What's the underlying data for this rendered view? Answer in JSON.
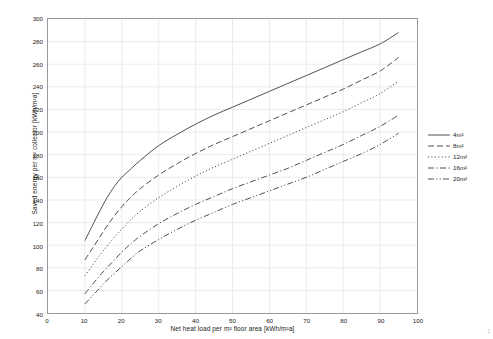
{
  "chart_data": {
    "type": "line",
    "title": "",
    "xlabel": "Net heat load per m² floor area [kWh/m²a]",
    "ylabel": "Saved energy per m² collector [kWh/m²a]",
    "xlim": [
      0,
      100
    ],
    "ylim": [
      40,
      300
    ],
    "xticks": [
      0,
      10,
      20,
      30,
      40,
      50,
      60,
      70,
      80,
      90,
      100
    ],
    "yticks": [
      40,
      60,
      80,
      100,
      120,
      140,
      160,
      180,
      200,
      220,
      240,
      260,
      280,
      300
    ],
    "grid": true,
    "grid_color": "#e2e2e8",
    "legend_position": "right",
    "x": [
      10,
      12,
      14,
      16,
      18,
      20,
      22,
      25,
      30,
      35,
      40,
      45,
      50,
      55,
      60,
      65,
      70,
      75,
      80,
      85,
      90,
      95
    ],
    "series": [
      {
        "name": "4m²",
        "dash": "solid",
        "color": "#3c3c3c",
        "values": [
          104,
          117,
          130,
          142,
          152,
          160,
          166,
          175,
          188,
          198,
          207,
          215,
          222,
          229,
          236,
          243,
          250,
          257,
          264,
          271,
          278,
          288
        ]
      },
      {
        "name": "8m²",
        "dash": "dashed",
        "color": "#3c3c3c",
        "values": [
          87,
          97,
          107,
          117,
          126,
          134,
          141,
          150,
          162,
          172,
          181,
          189,
          196,
          203,
          210,
          217,
          224,
          231,
          238,
          246,
          254,
          266
        ]
      },
      {
        "name": "12m²",
        "dash": "dotted",
        "color": "#3c3c3c",
        "values": [
          73,
          82,
          91,
          99,
          107,
          114,
          121,
          130,
          142,
          152,
          161,
          169,
          176,
          183,
          190,
          197,
          204,
          211,
          218,
          226,
          234,
          245
        ]
      },
      {
        "name": "16m²",
        "dash": "dash-dot",
        "color": "#3c3c3c",
        "values": [
          57,
          65,
          73,
          80,
          87,
          94,
          100,
          108,
          119,
          128,
          136,
          143,
          150,
          156,
          162,
          168,
          175,
          182,
          189,
          197,
          205,
          215
        ]
      },
      {
        "name": "20m²",
        "dash": "dash-dot-dot",
        "color": "#3c3c3c",
        "values": [
          48,
          55,
          62,
          69,
          75,
          81,
          87,
          95,
          105,
          114,
          122,
          129,
          136,
          142,
          148,
          154,
          160,
          167,
          174,
          181,
          189,
          199
        ]
      }
    ]
  },
  "corner": {
    "mark": "1"
  }
}
